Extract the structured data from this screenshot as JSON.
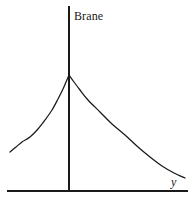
{
  "figure": {
    "background_color": "#ffffff",
    "stroke_color": "#1a1a1a",
    "labels": {
      "brane": "Brane",
      "y_axis": "y"
    }
  },
  "chart_data": {
    "type": "line",
    "title": "",
    "subtitle": "",
    "xlabel": "y",
    "ylabel": "",
    "legend": [],
    "grid": false,
    "annotations": [
      {
        "text": "Brane",
        "x": 69,
        "y": 17,
        "role": "vertical-axis-label"
      },
      {
        "text": "y",
        "x": 175,
        "y": 182,
        "role": "horizontal-axis-label"
      }
    ],
    "axes": {
      "vertical_line": {
        "x": 69,
        "y_top": 6,
        "y_bottom": 191
      },
      "horizontal_line": {
        "y": 191,
        "x_left": 7,
        "x_right": 188
      }
    },
    "peak": {
      "x": 69,
      "y": 75,
      "shape": "cusp"
    },
    "series": [
      {
        "name": "warp-factor-left-branch",
        "points": [
          [
            10,
            152
          ],
          [
            16,
            147
          ],
          [
            22,
            142
          ],
          [
            30,
            137
          ],
          [
            38,
            129
          ],
          [
            45,
            120
          ],
          [
            52,
            110
          ],
          [
            58,
            99
          ],
          [
            63,
            89
          ],
          [
            66,
            82
          ],
          [
            69,
            75
          ]
        ]
      },
      {
        "name": "warp-factor-right-branch",
        "points": [
          [
            69,
            75
          ],
          [
            74,
            82
          ],
          [
            80,
            90
          ],
          [
            88,
            100
          ],
          [
            100,
            112
          ],
          [
            112,
            124
          ],
          [
            125,
            135
          ],
          [
            138,
            147
          ],
          [
            150,
            157
          ],
          [
            162,
            166
          ],
          [
            174,
            173
          ],
          [
            185,
            178
          ]
        ]
      }
    ],
    "xlim": [
      0,
      195
    ],
    "ylim": [
      205,
      0
    ]
  }
}
